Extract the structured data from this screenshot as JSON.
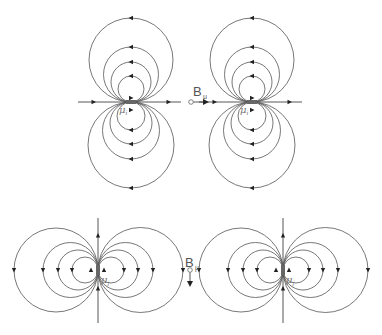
{
  "diagram": {
    "panels": [
      {
        "id": "top-left",
        "orientation": "horizontal",
        "moment_label": "μ",
        "moment_subscript": "i"
      },
      {
        "id": "top-right",
        "orientation": "horizontal",
        "moment_label": "μ",
        "moment_subscript": "i"
      },
      {
        "id": "bottom-left",
        "orientation": "vertical",
        "moment_label": "μ",
        "moment_subscript": "j"
      },
      {
        "id": "bottom-right",
        "orientation": "vertical",
        "moment_label": "μ",
        "moment_subscript": "j"
      }
    ],
    "field_labels": {
      "top": {
        "main": "B",
        "sub": "μ",
        "direction": "right"
      },
      "bottom": {
        "main": "B",
        "sub": "μ",
        "direction": "down"
      }
    },
    "colors": {
      "line": "#555555",
      "arrow": "#222222",
      "label": "#555555"
    }
  }
}
